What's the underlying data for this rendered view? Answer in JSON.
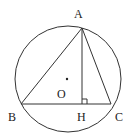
{
  "diagram": {
    "type": "geometry",
    "points": {
      "A": {
        "label": "A"
      },
      "B": {
        "label": "B"
      },
      "C": {
        "label": "C"
      },
      "H": {
        "label": "H"
      },
      "O": {
        "label": "O"
      }
    },
    "segments": [
      "AB",
      "AC",
      "BC",
      "AH"
    ],
    "right_angle_at": "H",
    "circle_center": "O",
    "colors": {
      "line": "#333333",
      "text": "#222222",
      "background": "#ffffff"
    }
  }
}
